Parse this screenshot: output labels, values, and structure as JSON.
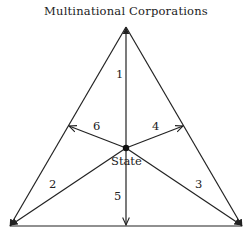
{
  "title": "Multinational Corporations",
  "center_label": "State",
  "arrows": [
    {
      "id": "1",
      "label": "1",
      "from": "State",
      "to": "Multinational Corporations"
    },
    {
      "id": "2",
      "label": "2",
      "from": "State",
      "to": "bottom-left"
    },
    {
      "id": "3",
      "label": "3",
      "from": "State",
      "to": "bottom-right"
    },
    {
      "id": "4",
      "label": "4",
      "from": "State",
      "to": "right-side"
    },
    {
      "id": "5",
      "label": "5",
      "from": "State",
      "to": "bottom"
    },
    {
      "id": "6",
      "label": "6",
      "from": "State",
      "to": "left-side"
    }
  ],
  "colors": {
    "line": "#222222",
    "background": "#ffffff"
  }
}
